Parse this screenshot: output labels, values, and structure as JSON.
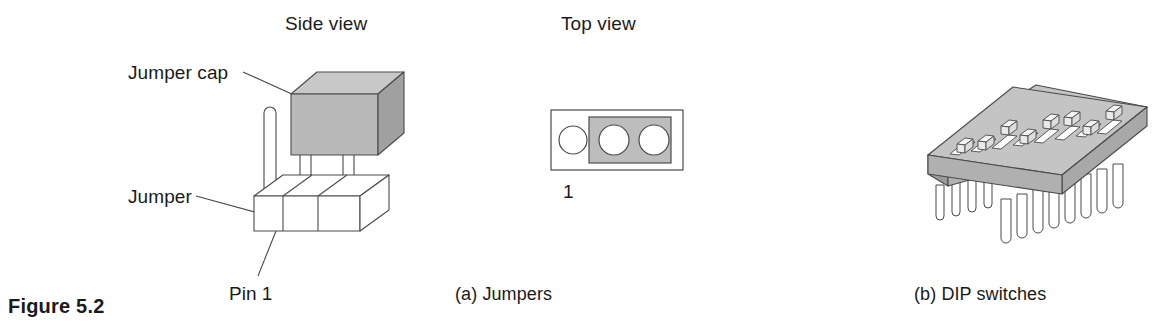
{
  "figure": {
    "number_label": "Figure 5.2",
    "background_color": "#ffffff",
    "ink_color": "#1a1a1a",
    "line_color": "#4a4a4a"
  },
  "panel_a": {
    "sub_caption": "(a) Jumpers",
    "side_view": {
      "heading": "Side view",
      "callouts": [
        {
          "id": "jumper-cap",
          "text": "Jumper cap"
        },
        {
          "id": "jumper",
          "text": "Jumper"
        }
      ],
      "pin_label": "Pin 1",
      "pin_count": 3,
      "capped_pins": 2,
      "cap_color_front": "#b9b9b9",
      "cap_color_top": "#c8c8c8",
      "cap_color_side": "#a0a0a0",
      "base_color": "#ffffff"
    },
    "top_view": {
      "heading": "Top view",
      "index_label": "1",
      "hole_count": 3,
      "covered_holes": 2,
      "cap_color": "#bdbdbd",
      "body_color": "#ffffff"
    }
  },
  "panel_b": {
    "sub_caption": "(b) DIP switches",
    "switch_count": 8,
    "pin_count": 8,
    "body_color_top": "#c4c4c4",
    "body_color_front": "#b0b0b0",
    "body_color_left": "#9a9a9a",
    "actuator_color": "#f4f4f4",
    "slot_color": "#ffffff",
    "switch_states": [
      "down",
      "down",
      "up",
      "down",
      "up",
      "up",
      "down",
      "up"
    ]
  }
}
